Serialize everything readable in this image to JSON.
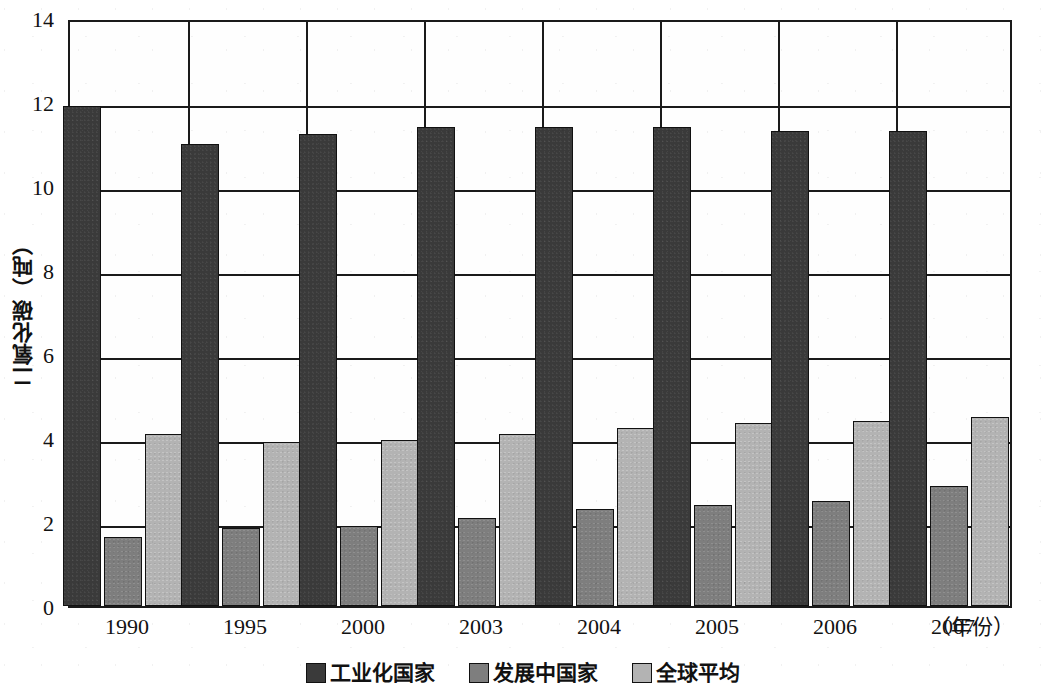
{
  "chart_data": {
    "type": "bar",
    "title": "",
    "subtitle": "",
    "xlabel": "（年份）",
    "ylabel": "二氧化碳（吨）",
    "categories": [
      "1990",
      "1995",
      "2000",
      "2003",
      "2004",
      "2005",
      "2006",
      "2007"
    ],
    "series": [
      {
        "name": "工业化国家",
        "color": "#3a3a3a",
        "values": [
          11.9,
          11.0,
          11.25,
          11.4,
          11.4,
          11.4,
          11.3,
          11.3
        ]
      },
      {
        "name": "发展中国家",
        "color": "#7e7e7e",
        "values": [
          1.65,
          1.85,
          1.9,
          2.1,
          2.3,
          2.4,
          2.5,
          2.85
        ]
      },
      {
        "name": "全球平均",
        "color": "#b3b3b3",
        "values": [
          4.1,
          3.9,
          3.95,
          4.1,
          4.25,
          4.35,
          4.4,
          4.5
        ]
      }
    ],
    "ylim": [
      0,
      14
    ],
    "ytick_labels": [
      "0",
      "2",
      "4",
      "6",
      "8",
      "10",
      "12",
      "14"
    ],
    "ytick_values": [
      0,
      2,
      4,
      6,
      8,
      10,
      12,
      14
    ],
    "grid": "horizontal-and-vertical-category-separators",
    "legend_position": "bottom-center"
  },
  "legend": {
    "items": [
      {
        "label": "工业化国家",
        "swatch": "dark-gray-swatch-icon"
      },
      {
        "label": "发展中国家",
        "swatch": "medium-gray-swatch-icon"
      },
      {
        "label": "全球平均",
        "swatch": "light-gray-swatch-icon"
      }
    ]
  },
  "axes": {
    "y_title": "二氧化碳（吨）",
    "x_unit": "（年份）"
  }
}
